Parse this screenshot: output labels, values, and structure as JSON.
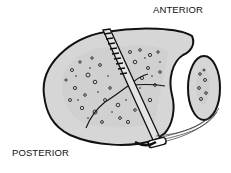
{
  "diagram": {
    "labels": {
      "anterior": "ANTERIOR",
      "posterior": "POSTERIOR"
    },
    "elements": [
      {
        "name": "main-bone",
        "description": "Large oval bone section with cortical rim and cancellous interior"
      },
      {
        "name": "small-bone",
        "description": "Small oval bone on right with cancellous core"
      },
      {
        "name": "screw",
        "description": "Threaded screw passing diagonally through main bone"
      },
      {
        "name": "fracture-lines",
        "description": "Cracks across cancellous bone"
      },
      {
        "name": "ligament",
        "description": "Fibrous band connecting small bone to screw head"
      },
      {
        "name": "screw-head-washer",
        "description": "Rounded washer/head at bottom"
      }
    ],
    "colors": {
      "bone_fill": "#d6d6d6",
      "outline": "#111111",
      "background": "#ffffff"
    }
  }
}
